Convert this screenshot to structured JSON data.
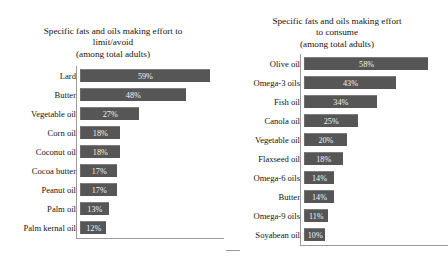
{
  "chart_data": [
    {
      "type": "bar",
      "orientation": "horizontal",
      "title": "Specific fats and oils making effort to limit/avoid (among total adults)",
      "title_lines": [
        "Specific fats and oils making effort to",
        "limit/avoid",
        "(among total adults)"
      ],
      "xlabel": "",
      "ylabel": "",
      "xlim": [
        0,
        62
      ],
      "grid": false,
      "legend": "none",
      "value_suffix": "%",
      "categories": [
        "Lard",
        "Butter",
        "Vegetable oil",
        "Corn oil",
        "Coconut oil",
        "Cocoa butter",
        "Peanut oil",
        "Palm oil",
        "Palm kernal oil"
      ],
      "values": [
        59,
        48,
        27,
        18,
        18,
        17,
        17,
        13,
        12
      ],
      "labels": [
        "59%",
        "48%",
        "27%",
        "18%",
        "18%",
        "17%",
        "17%",
        "13%",
        "12%"
      ]
    },
    {
      "type": "bar",
      "orientation": "horizontal",
      "title": "Specific fats and oils making effort to consume (among total adults)",
      "title_lines": [
        "Specific fats and oils making effort",
        "to consume",
        "(among total adults)"
      ],
      "xlabel": "",
      "ylabel": "",
      "xlim": [
        0,
        62
      ],
      "grid": false,
      "legend": "none",
      "value_suffix": "%",
      "categories": [
        "Olive oil",
        "Omega-3 oils",
        "Fish oil",
        "Canola oil",
        "Vegetable oil",
        "Flaxseed oil",
        "Omega-6 oils",
        "Butter",
        "Omega-9 oils",
        "Soyabean oil"
      ],
      "values": [
        58,
        43,
        34,
        25,
        20,
        18,
        14,
        14,
        11,
        10
      ],
      "labels": [
        "58%",
        "43%",
        "34%",
        "25%",
        "20%",
        "18%",
        "14%",
        "14%",
        "11%",
        "10%"
      ]
    }
  ],
  "style": {
    "bar_color": "#565656",
    "bar_label_color": "#f2f2f2",
    "axis_color": "#9a9a9a",
    "text_color": "#141414",
    "background": "#ffffff"
  }
}
